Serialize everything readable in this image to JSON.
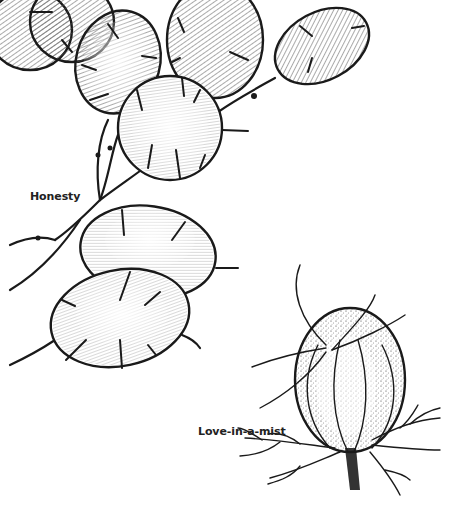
{
  "illustration": {
    "style": "black ink botanical line drawing with hatching and stippling",
    "background": "#ffffff",
    "ink_color": "#1a1a1a",
    "labels": [
      {
        "id": "honesty",
        "text": "Honesty"
      },
      {
        "id": "love-in-a-mist",
        "text": "Love-in-a-mist"
      }
    ],
    "subjects": [
      {
        "name": "Honesty",
        "depicts": "flat oval translucent seed pods on branching stems"
      },
      {
        "name": "Love-in-a-mist",
        "depicts": "inflated striped seed capsule with curling horns and feathery leaves"
      }
    ]
  }
}
